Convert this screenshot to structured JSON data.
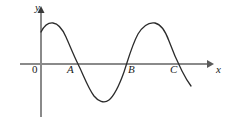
{
  "figure": {
    "title": "",
    "background_color": "#ffffff",
    "width": 232,
    "height": 120
  },
  "axes": {
    "x_axis": {
      "label": "x",
      "color": "#8a8a8a",
      "arrow": "right-arrow",
      "start_px": 20,
      "end_px": 213,
      "y_px": 64
    },
    "y_axis": {
      "label": "y",
      "color": "#8a8a8a",
      "arrow": "up-arrow",
      "x_px": 41,
      "top_px": 7,
      "bottom_px": 117
    },
    "origin_label": "0"
  },
  "marked_points": [
    {
      "label": "A",
      "x_px": 78,
      "label_x_px": 67,
      "label_y_px": 64
    },
    {
      "label": "B",
      "x_px": 127,
      "label_x_px": 128,
      "label_y_px": 64
    },
    {
      "label": "C",
      "x_px": 181,
      "label_x_px": 170,
      "label_y_px": 64
    }
  ],
  "curve": {
    "name": "sinusoidal-curve",
    "color": "#2b2b2b",
    "stroke_width": 1.3,
    "path": "M 41,32 C 44,26 48,22.5 53,23 C 58,23.5 62,28 66,37 C 70,46 74,56 78,64 C 83,74 88,88 94,96 C 98,101 104,104 109,100 C 115,95 119,86 124,72 C 128,60 132,45 138,34 C 143,26 149,22 155,23 C 160,24 165,30 169,41 C 173,52 178,63 182,71 C 185,77 188,82 191,86"
  },
  "chart_data": {
    "type": "line",
    "title": "",
    "xlabel": "x",
    "ylabel": "y",
    "grid": false,
    "legend": null,
    "annotations": [
      "0",
      "A",
      "B",
      "C"
    ],
    "x_axis_crossings": [
      "A",
      "B",
      "C"
    ],
    "x": [
      41,
      53,
      78,
      102,
      127,
      155,
      181,
      191
    ],
    "y_pixel": [
      32,
      23,
      64,
      102,
      64,
      23,
      64,
      86
    ],
    "features": [
      {
        "kind": "y-intercept",
        "x_px": 41,
        "y_px": 32
      },
      {
        "kind": "maximum",
        "x_px": 53,
        "y_px": 23
      },
      {
        "kind": "zero",
        "label": "A",
        "x_px": 78,
        "y_px": 64
      },
      {
        "kind": "minimum",
        "x_px": 102,
        "y_px": 102
      },
      {
        "kind": "zero",
        "label": "B",
        "x_px": 127,
        "y_px": 64
      },
      {
        "kind": "maximum",
        "x_px": 155,
        "y_px": 23
      },
      {
        "kind": "zero",
        "label": "C",
        "x_px": 181,
        "y_px": 64
      },
      {
        "kind": "endpoint",
        "x_px": 191,
        "y_px": 86
      }
    ]
  }
}
